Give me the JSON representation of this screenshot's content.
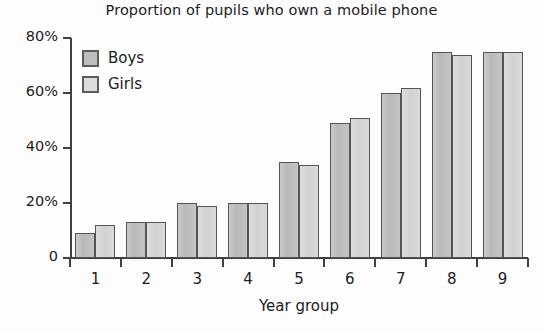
{
  "chart_data": {
    "type": "bar",
    "title": "Proportion of pupils who own a mobile phone",
    "xlabel": "Year group",
    "ylabel": "",
    "categories": [
      "1",
      "2",
      "3",
      "4",
      "5",
      "6",
      "7",
      "8",
      "9"
    ],
    "series": [
      {
        "name": "Boys",
        "color": "#bdbdbd",
        "values": [
          9,
          13,
          20,
          20,
          35,
          49,
          60,
          75,
          75
        ]
      },
      {
        "name": "Girls",
        "color": "#dcdcdc",
        "values": [
          12,
          13,
          19,
          20,
          34,
          51,
          62,
          74,
          75
        ]
      }
    ],
    "ylim": [
      0,
      80
    ],
    "yticks": [
      0,
      20,
      40,
      60,
      80
    ],
    "ytick_labels": [
      "0",
      "20%",
      "40%",
      "60%",
      "80%"
    ],
    "grid": false,
    "legend_position": "top-left"
  },
  "axes": {
    "y_ticks": [
      {
        "label": "80%",
        "value": 80
      },
      {
        "label": "60%",
        "value": 60
      },
      {
        "label": "40%",
        "value": 40
      },
      {
        "label": "20%",
        "value": 20
      },
      {
        "label": "0",
        "value": 0
      }
    ],
    "x_title": "Year group",
    "x_ticks": [
      "1",
      "2",
      "3",
      "4",
      "5",
      "6",
      "7",
      "8",
      "9"
    ]
  },
  "legend": {
    "items": [
      {
        "label": "Boys"
      },
      {
        "label": "Girls"
      }
    ]
  }
}
